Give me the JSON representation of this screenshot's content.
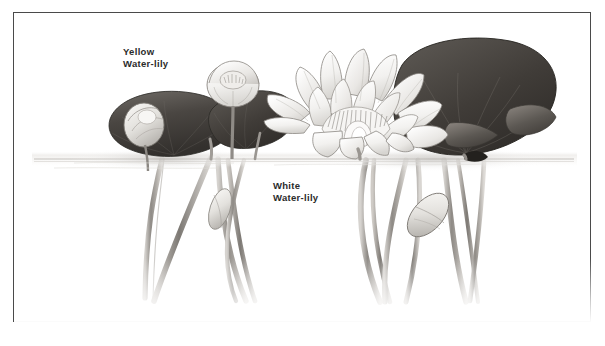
{
  "plate": {
    "title": "Water-lily botanical illustration plate",
    "medium": "pencil drawing",
    "background_color": "#ffffff",
    "border_color": "#4a4a4a",
    "ink_color": "#2b2b2b"
  },
  "labels": {
    "yellow": {
      "line1": "Yellow",
      "line2": "Water-lily",
      "full": "Yellow Water-lily"
    },
    "white": {
      "line1": "White",
      "line2": "Water-lily",
      "full": "White Water-lily"
    }
  },
  "scene": {
    "waterline_label": "water surface",
    "subjects": [
      "yellow-water-lily-flower",
      "yellow-water-lily-bud",
      "white-water-lily-flower",
      "lily-pads",
      "underwater-stems",
      "underwater-buds"
    ]
  }
}
